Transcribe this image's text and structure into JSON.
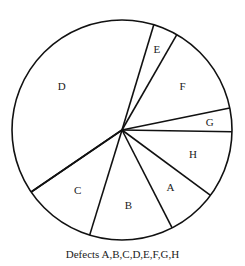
{
  "chart_data": {
    "type": "pie",
    "title": "",
    "caption": "Defects A,B,C,D,E,F,G,H",
    "categories": [
      "A",
      "B",
      "C",
      "D",
      "E",
      "F",
      "G",
      "H"
    ],
    "values_percent": [
      7.4,
      12.3,
      10.7,
      39.2,
      3.6,
      13.5,
      3.4,
      9.9
    ],
    "slices": [
      {
        "label": "E",
        "start_deg": 60.1,
        "end_deg": 73.2
      },
      {
        "label": "F",
        "start_deg": 11.5,
        "end_deg": 60.1
      },
      {
        "label": "G",
        "start_deg": -0.9,
        "end_deg": 11.5
      },
      {
        "label": "H",
        "start_deg": -36.4,
        "end_deg": -0.9
      },
      {
        "label": "A",
        "start_deg": -62.9,
        "end_deg": -36.4
      },
      {
        "label": "B",
        "start_deg": -107.1,
        "end_deg": -62.9
      },
      {
        "label": "C",
        "start_deg": -145.7,
        "end_deg": -107.1
      },
      {
        "label": "D",
        "start_deg": 73.2,
        "end_deg": 214.3
      }
    ],
    "legend": "none",
    "colors": {
      "fill": "#ffffff",
      "stroke": "#111111",
      "text": "#222222"
    }
  }
}
